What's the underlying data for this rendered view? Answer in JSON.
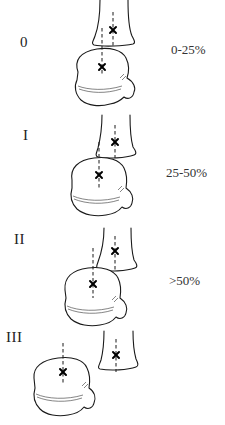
{
  "figure": {
    "stages": [
      {
        "grade": "0",
        "displacement": "0-25%"
      },
      {
        "grade": "I",
        "displacement": "25-50%"
      },
      {
        "grade": "II",
        "displacement": ">50%"
      },
      {
        "grade": "III",
        "displacement": ""
      }
    ],
    "marker_symbol": "×"
  }
}
